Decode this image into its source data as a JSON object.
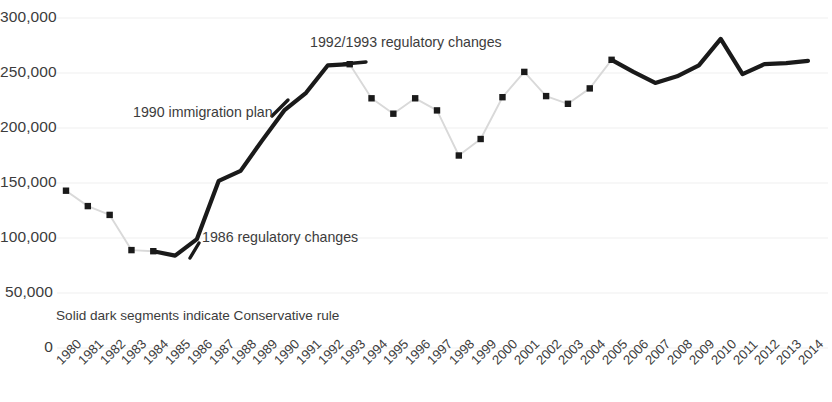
{
  "chart_data": {
    "type": "line",
    "title": "",
    "xlabel": "",
    "ylabel": "",
    "ylim": [
      0,
      300000
    ],
    "ytick_labels": [
      "300,000",
      "250,000",
      "200,000",
      "150,000",
      "100,000",
      "50,000",
      "0"
    ],
    "ytick_values": [
      300000,
      250000,
      200000,
      150000,
      100000,
      50000,
      0
    ],
    "grid": true,
    "legend_position": "none",
    "categories": [
      "1980",
      "1981",
      "1982",
      "1983",
      "1984",
      "1985",
      "1986",
      "1987",
      "1988",
      "1989",
      "1990",
      "1991",
      "1992",
      "1993",
      "1994",
      "1995",
      "1996",
      "1997",
      "1998",
      "1999",
      "2000",
      "2001",
      "2002",
      "2003",
      "2004",
      "2005",
      "2006",
      "2007",
      "2008",
      "2009",
      "2010",
      "2011",
      "2012",
      "2013",
      "2014"
    ],
    "values": [
      143000,
      129000,
      121000,
      89000,
      88000,
      84000,
      99000,
      152000,
      161000,
      189000,
      216000,
      232000,
      257000,
      258000,
      227000,
      213000,
      227000,
      216000,
      175000,
      190000,
      228000,
      251000,
      229000,
      222000,
      236000,
      262000,
      251000,
      241000,
      247000,
      257000,
      281000,
      249000,
      258000,
      259000,
      261000
    ],
    "segment_styles": [
      {
        "name": "light-segment-1980-1984",
        "from": "1980",
        "to": "1984",
        "style": "light",
        "color": "#d9d9d9",
        "markers": true
      },
      {
        "name": "dark-segment-1984-1993",
        "from": "1984",
        "to": "1993",
        "style": "solid-dark",
        "color": "#1a1a1a",
        "markers": false
      },
      {
        "name": "light-segment-1993-2005",
        "from": "1993",
        "to": "2005",
        "style": "light",
        "color": "#d9d9d9",
        "markers": true
      },
      {
        "name": "dark-segment-2005-2014",
        "from": "2005",
        "to": "2014",
        "style": "solid-dark",
        "color": "#1a1a1a",
        "markers": false
      }
    ],
    "annotations": [
      {
        "name": "annotation-1992-1993",
        "text": "1992/1993 regulatory changes",
        "x": 1992,
        "y": 272000
      },
      {
        "name": "annotation-1990",
        "text": "1990 immigration plan",
        "x": 1987,
        "y": 211000
      },
      {
        "name": "annotation-1986",
        "text": "1986 regulatory changes",
        "x": 1986,
        "y": 107000
      },
      {
        "name": "legend-caption",
        "text": "Solid dark segments indicate Conservative rule",
        "x": 1980,
        "y": 34000
      }
    ],
    "colors": {
      "dark_line": "#1a1a1a",
      "light_line": "#d9d9d9",
      "marker": "#1a1a1a",
      "gridline": "#efefef",
      "text": "#3c3c3c",
      "background": "#ffffff"
    }
  },
  "annotations": {
    "regulatory_1992": "1992/1993 regulatory changes",
    "immigration_plan_1990": "1990 immigration plan",
    "regulatory_1986": "1986 regulatory changes",
    "caption": "Solid dark segments indicate Conservative rule"
  }
}
